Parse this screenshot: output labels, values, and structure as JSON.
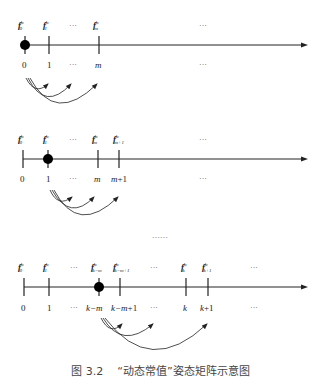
{
  "figure": {
    "caption_number": "图 3.2",
    "caption_title": "“动态常值”姿态矩阵示意图",
    "ellipsis_between_rows": "……",
    "superscript": "b",
    "f_symbol": "f"
  },
  "rows": [
    {
      "name": "row-1",
      "current_index": "0",
      "top_labels": [
        {
          "sub": "0"
        },
        {
          "sub": "1"
        },
        {
          "text": "···"
        },
        {
          "sub": "m"
        },
        {
          "text": "···"
        }
      ],
      "bottom_labels": [
        "0",
        "1",
        "···",
        "m",
        "···"
      ],
      "arcs_to": [
        "1",
        "···",
        "m"
      ]
    },
    {
      "name": "row-2",
      "current_index": "1",
      "top_labels": [
        {
          "sub": "0"
        },
        {
          "sub": "1"
        },
        {
          "text": "···"
        },
        {
          "sub": "m"
        },
        {
          "sub": "m+1"
        },
        {
          "text": "···"
        }
      ],
      "bottom_labels": [
        "0",
        "1",
        "···",
        "m",
        "m+1",
        "···"
      ],
      "arcs_to": [
        "···",
        "m",
        "m+1"
      ]
    },
    {
      "name": "row-3",
      "current_index": "k−m",
      "top_labels": [
        {
          "sub": "0"
        },
        {
          "sub": "1"
        },
        {
          "text": "···"
        },
        {
          "sub": "k−m"
        },
        {
          "sub": "k−m+1"
        },
        {
          "text": "···"
        },
        {
          "sub": "k"
        },
        {
          "sub": "k+1"
        },
        {
          "text": "···"
        }
      ],
      "bottom_labels": [
        "0",
        "1",
        "···",
        "k−m",
        "k−m+1",
        "···",
        "k",
        "k+1",
        "···"
      ],
      "arcs_to": [
        "k−m+1",
        "···",
        "k+1"
      ]
    }
  ]
}
